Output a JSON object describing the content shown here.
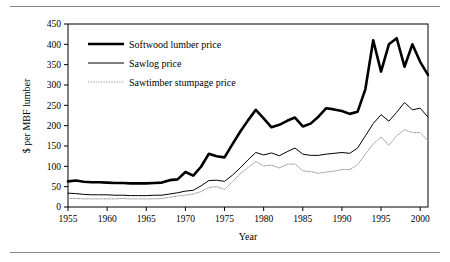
{
  "figure": {
    "name": "softwood-lumber-price-chart",
    "top_rule": true,
    "bottom_rule": true
  },
  "chart_data": {
    "type": "line",
    "title": "",
    "xlabel": "Year",
    "ylabel": "$ per MBF lumber",
    "xlim": [
      1955,
      2001
    ],
    "ylim": [
      0,
      450
    ],
    "xticks": [
      1955,
      1960,
      1965,
      1970,
      1975,
      1980,
      1985,
      1990,
      1995,
      2000
    ],
    "yticks": [
      0,
      50,
      100,
      150,
      200,
      250,
      300,
      350,
      400,
      450
    ],
    "grid": false,
    "legend_position": "top-left",
    "x": [
      1955,
      1956,
      1957,
      1958,
      1959,
      1960,
      1961,
      1962,
      1963,
      1964,
      1965,
      1966,
      1967,
      1968,
      1969,
      1970,
      1971,
      1972,
      1973,
      1974,
      1975,
      1976,
      1977,
      1978,
      1979,
      1980,
      1981,
      1982,
      1983,
      1984,
      1985,
      1986,
      1987,
      1988,
      1989,
      1990,
      1991,
      1992,
      1993,
      1994,
      1995,
      1996,
      1997,
      1998,
      1999,
      2000,
      2001
    ],
    "series": [
      {
        "name": "Softwood lumber price",
        "style": "thick-solid",
        "color": "#000000",
        "width": 2.6,
        "values": [
          63,
          65,
          62,
          61,
          61,
          60,
          59,
          59,
          58,
          58,
          58,
          59,
          60,
          66,
          68,
          86,
          77,
          99,
          131,
          125,
          122,
          154,
          185,
          213,
          239,
          218,
          196,
          202,
          212,
          220,
          198,
          205,
          222,
          243,
          240,
          236,
          229,
          234,
          290,
          410,
          333,
          400,
          415,
          345,
          400,
          357,
          325
        ]
      },
      {
        "name": "Sawlog price",
        "style": "thin-solid",
        "color": "#000000",
        "width": 1.0,
        "values": [
          34,
          33,
          31,
          30,
          30,
          30,
          29,
          29,
          28,
          28,
          28,
          29,
          29,
          32,
          35,
          39,
          41,
          52,
          65,
          66,
          63,
          78,
          96,
          116,
          134,
          128,
          133,
          126,
          136,
          145,
          130,
          127,
          127,
          130,
          132,
          134,
          132,
          145,
          175,
          205,
          227,
          211,
          233,
          257,
          239,
          243,
          221
        ]
      },
      {
        "name": "Sawtimber stumpage price",
        "style": "dotted",
        "color": "#9a9a9a",
        "width": 1.0,
        "values": [
          21,
          21,
          20,
          20,
          20,
          20,
          20,
          21,
          20,
          20,
          20,
          20,
          21,
          24,
          27,
          29,
          32,
          38,
          48,
          50,
          43,
          62,
          82,
          97,
          112,
          101,
          103,
          96,
          105,
          106,
          89,
          87,
          83,
          86,
          88,
          92,
          92,
          104,
          130,
          155,
          172,
          152,
          175,
          190,
          183,
          183,
          163
        ]
      }
    ]
  },
  "legend": {
    "items": [
      {
        "label": "Softwood lumber price"
      },
      {
        "label": "Sawlog price"
      },
      {
        "label": "Sawtimber stumpage price"
      }
    ]
  },
  "axes": {
    "y_title": "$ per MBF lumber",
    "x_title": "Year",
    "ytick_labels": [
      "450",
      "400",
      "350",
      "300",
      "250",
      "200",
      "150",
      "100",
      "50",
      "0"
    ],
    "xtick_labels": [
      "1955",
      "1960",
      "1965",
      "1970",
      "1975",
      "1980",
      "1985",
      "1990",
      "1995",
      "2000"
    ]
  }
}
